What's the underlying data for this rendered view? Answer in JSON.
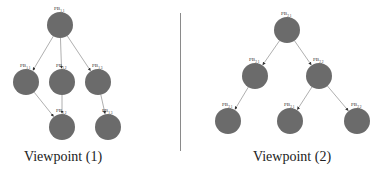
{
  "note": "Node labels render as 'PB' with a subscript. The subscripts were unreadable at the available resolution; values below are best guesses and are not verified.",
  "viewpoints": [
    {
      "caption": "Viewpoint (1)",
      "caption_pos": [
        63,
        157
      ],
      "nodes": [
        {
          "id": "r",
          "x": 60,
          "y": 25,
          "label_base": "PB",
          "label_sub_guess": "1,1",
          "label_sub_confidence": "low"
        },
        {
          "id": "m1",
          "x": 26,
          "y": 82,
          "label_base": "PB",
          "label_sub_guess": "1,1",
          "label_sub_confidence": "low"
        },
        {
          "id": "m2",
          "x": 62,
          "y": 82,
          "label_base": "PB",
          "label_sub_guess": "1,2",
          "label_sub_confidence": "low"
        },
        {
          "id": "m3",
          "x": 98,
          "y": 82,
          "label_base": "PB",
          "label_sub_guess": "1,3",
          "label_sub_confidence": "low"
        },
        {
          "id": "b1",
          "x": 62,
          "y": 127,
          "label_base": "PB",
          "label_sub_guess": "1,2",
          "label_sub_confidence": "low"
        },
        {
          "id": "b2",
          "x": 108,
          "y": 127,
          "label_base": "PB",
          "label_sub_guess": "1,3",
          "label_sub_confidence": "low"
        }
      ],
      "edges": [
        [
          "r",
          "m1"
        ],
        [
          "r",
          "m2"
        ],
        [
          "r",
          "m3"
        ],
        [
          "m1",
          "b1"
        ],
        [
          "m2",
          "b1"
        ],
        [
          "m3",
          "b2"
        ]
      ]
    },
    {
      "caption": "Viewpoint (2)",
      "caption_pos": [
        292,
        157
      ],
      "nodes": [
        {
          "id": "r",
          "x": 287,
          "y": 30,
          "label_base": "PB",
          "label_sub_guess": "2,1",
          "label_sub_confidence": "low"
        },
        {
          "id": "m1",
          "x": 255,
          "y": 76,
          "label_base": "PB",
          "label_sub_guess": "2,1",
          "label_sub_confidence": "low"
        },
        {
          "id": "m2",
          "x": 319,
          "y": 76,
          "label_base": "PB",
          "label_sub_guess": "2,2",
          "label_sub_confidence": "low"
        },
        {
          "id": "b1",
          "x": 228,
          "y": 121,
          "label_base": "PB",
          "label_sub_guess": "2,1",
          "label_sub_confidence": "low"
        },
        {
          "id": "b2",
          "x": 290,
          "y": 121,
          "label_base": "PB",
          "label_sub_guess": "2,1",
          "label_sub_confidence": "low"
        },
        {
          "id": "b3",
          "x": 357,
          "y": 121,
          "label_base": "PB",
          "label_sub_guess": "2,2",
          "label_sub_confidence": "low"
        }
      ],
      "edges": [
        [
          "r",
          "m1"
        ],
        [
          "r",
          "m2"
        ],
        [
          "m1",
          "b1"
        ],
        [
          "m2",
          "b2"
        ],
        [
          "m2",
          "b3"
        ]
      ]
    }
  ],
  "style": {
    "node_radius": 13,
    "node_color": "#6b6b6b",
    "edge_color": "#9a9a9a",
    "divider_color": "#8a8a8a"
  }
}
